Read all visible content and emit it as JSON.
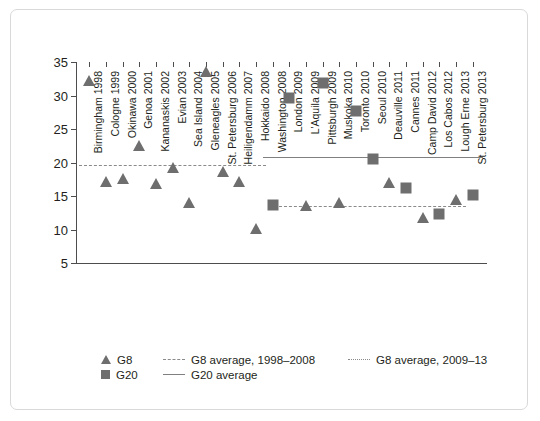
{
  "chart_data": {
    "type": "scatter",
    "title": "",
    "xlabel": "",
    "ylabel": "",
    "ylim": [
      5,
      35
    ],
    "yticks": [
      5,
      10,
      15,
      20,
      25,
      30,
      35
    ],
    "grid": false,
    "legend_position": "bottom-left",
    "categories": [
      "Birmingham 1998",
      "Cologne 1999",
      "Okinawa 2000",
      "Genoa 2001",
      "Kananaskis 2002",
      "Evian 2003",
      "Sea Island 2004",
      "Gleneagles 2005",
      "St. Petersburg 2006",
      "Heiligendamm 2007",
      "Hokkaido 2008",
      "Washington 2008",
      "London 2009",
      "L'Aquila 2009",
      "Pittsburgh 2009",
      "Muskoka 2010",
      "Toronto 2010",
      "Seoul 2010",
      "Deauville 2011",
      "Cannes 2011",
      "Camp David 2012",
      "Los Cabos 2012",
      "Lough Erne 2013",
      "St. Petersburg 2013"
    ],
    "series": [
      {
        "name": "G8",
        "marker": "triangle",
        "color": "#6e6e6e",
        "points": [
          {
            "category": "Birmingham 1998",
            "value": 32.0
          },
          {
            "category": "Cologne 1999",
            "value": 17.0
          },
          {
            "category": "Okinawa 2000",
            "value": 17.4
          },
          {
            "category": "Genoa 2001",
            "value": 22.3
          },
          {
            "category": "Kananaskis 2002",
            "value": 16.7
          },
          {
            "category": "Evian 2003",
            "value": 19.0
          },
          {
            "category": "Sea Island 2004",
            "value": 13.8
          },
          {
            "category": "Gleneagles 2005",
            "value": 33.4
          },
          {
            "category": "St. Petersburg 2006",
            "value": 18.5
          },
          {
            "category": "Heiligendamm 2007",
            "value": 17.0
          },
          {
            "category": "Hokkaido 2008",
            "value": 10.0
          },
          {
            "category": "L'Aquila 2009",
            "value": 13.4
          },
          {
            "category": "Muskoka 2010",
            "value": 13.8
          },
          {
            "category": "Deauville 2011",
            "value": 16.8
          },
          {
            "category": "Camp David 2012",
            "value": 11.5
          },
          {
            "category": "Lough Erne 2013",
            "value": 14.2
          }
        ]
      },
      {
        "name": "G20",
        "marker": "square",
        "color": "#6e6e6e",
        "points": [
          {
            "category": "Washington 2008",
            "value": 13.6
          },
          {
            "category": "London 2009",
            "value": 29.6
          },
          {
            "category": "Pittsburgh 2009",
            "value": 31.9
          },
          {
            "category": "Toronto 2010",
            "value": 27.7
          },
          {
            "category": "Seoul 2010",
            "value": 20.5
          },
          {
            "category": "Cannes 2011",
            "value": 16.2
          },
          {
            "category": "Los Cabos 2012",
            "value": 12.3
          },
          {
            "category": "St. Petersburg 2013",
            "value": 15.1
          }
        ]
      }
    ],
    "reference_lines": [
      {
        "name": "G8 average, 1998-2008",
        "style": "dashed",
        "value": 19.6,
        "from_category": "Birmingham 1998",
        "to_category": "Hokkaido 2008"
      },
      {
        "name": "G8 average, 2009-13",
        "style": "dotted",
        "value": 13.5,
        "from_category": "London 2009",
        "to_category": "Lough Erne 2013"
      },
      {
        "name": "G20 average",
        "style": "solid",
        "value": 20.8,
        "from_category": "Washington 2008",
        "to_category": "St. Petersburg 2013"
      }
    ]
  },
  "legend": {
    "rows": [
      {
        "marker_label": "G8",
        "marker_key": "triangle-marker-icon",
        "line_label": "G8 average, 1998–2008",
        "line_key": "dashed-line-icon",
        "extra_label": "G8 average, 2009–13",
        "extra_key": "dotted-line-icon"
      },
      {
        "marker_label": "G20",
        "marker_key": "square-marker-icon",
        "line_label": "G20 average",
        "line_key": "solid-line-icon",
        "extra_label": "",
        "extra_key": ""
      }
    ]
  },
  "colors": {
    "marker": "#6e6e6e",
    "line": "#808080",
    "axis": "#4d4d4d",
    "text": "#231f20",
    "frame": "#d9d9d9"
  }
}
